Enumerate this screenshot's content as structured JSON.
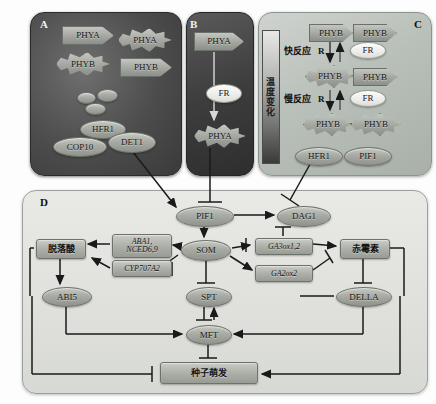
{
  "figure": {
    "panels": [
      "A",
      "B",
      "C",
      "D"
    ]
  },
  "panelA": {
    "label": "A",
    "nodes": [
      {
        "name": "phya-arrow",
        "label": "PHYA",
        "shape": "arrow"
      },
      {
        "name": "phya-star",
        "label": "PHYA",
        "shape": "star"
      },
      {
        "name": "phyb-star",
        "label": "PHYB",
        "shape": "star"
      },
      {
        "name": "phyb-arrow",
        "label": "PHYB",
        "shape": "arrow"
      },
      {
        "name": "hfr1",
        "label": "HFR1",
        "shape": "ellipse"
      },
      {
        "name": "cop10",
        "label": "COP10",
        "shape": "ellipse"
      },
      {
        "name": "det1",
        "label": "DET1",
        "shape": "ellipse"
      }
    ]
  },
  "panelB": {
    "label": "B",
    "nodes": [
      {
        "name": "phya-arrow",
        "label": "PHYA",
        "shape": "arrow"
      },
      {
        "name": "fr-signal",
        "label": "FR",
        "shape": "ellipse"
      },
      {
        "name": "phya-star",
        "label": "PHYA",
        "shape": "star"
      }
    ]
  },
  "panelC": {
    "label": "C",
    "temperature_bar": "温度变化",
    "responses": [
      {
        "name": "fast-response",
        "label": "快反应"
      },
      {
        "name": "slow-response",
        "label": "慢反应"
      }
    ],
    "light_labels": [
      {
        "name": "red-light-fast",
        "label": "R"
      },
      {
        "name": "far-red-fast",
        "label": "FR"
      },
      {
        "name": "red-light-slow",
        "label": "R"
      },
      {
        "name": "far-red-slow",
        "label": "FR"
      }
    ],
    "dimers": [
      {
        "name": "phyb-pr-dimer",
        "left": "PHYB",
        "right": "PHYB"
      },
      {
        "name": "phyb-mixed-dimer",
        "left": "PHYB",
        "right": "PHYB"
      },
      {
        "name": "phyb-pfr-dimer",
        "left": "PHYB",
        "right": "PHYB"
      }
    ],
    "nodes": [
      {
        "name": "hfr1",
        "label": "HFR1"
      },
      {
        "name": "pif1",
        "label": "PIF1"
      }
    ]
  },
  "panelD": {
    "label": "D",
    "nodes": [
      {
        "name": "pif1",
        "label": "PIF1",
        "shape": "ellipse"
      },
      {
        "name": "dag1",
        "label": "DAG1",
        "shape": "ellipse"
      },
      {
        "name": "som",
        "label": "SOM",
        "shape": "ellipse"
      },
      {
        "name": "spt",
        "label": "SPT",
        "shape": "ellipse"
      },
      {
        "name": "mft",
        "label": "MFT",
        "shape": "ellipse"
      },
      {
        "name": "abi5",
        "label": "ABI5",
        "shape": "ellipse"
      },
      {
        "name": "della",
        "label": "DELLA",
        "shape": "ellipse"
      }
    ],
    "genes": [
      {
        "name": "aba-biosynthesis-genes",
        "label": "ABA1,\nNCED6,9"
      },
      {
        "name": "aba-catabolism-gene",
        "label": "CYP707A2"
      },
      {
        "name": "ga-biosynthesis-gene",
        "label": "GA3ox1,2"
      },
      {
        "name": "ga-catabolism-gene",
        "label": "GA2ox2"
      }
    ],
    "hormones": [
      {
        "name": "abscisic-acid",
        "label": "脱落酸"
      },
      {
        "name": "gibberellin",
        "label": "赤霉素"
      }
    ],
    "outcome": {
      "name": "seed-germination",
      "label": "种子萌发"
    }
  },
  "colors": {
    "node_fill": "#a8aba4",
    "panel_dark": "#4c4c4c",
    "panel_light": "#b9bfb9",
    "panel_d": "#e3e4e0",
    "edge": "#1a1a1a"
  }
}
